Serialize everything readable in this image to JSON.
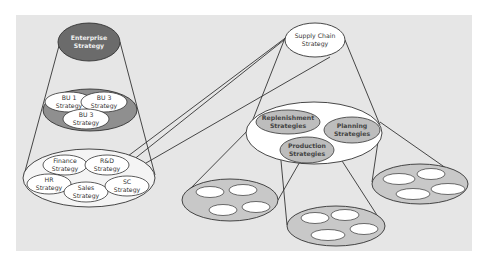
{
  "diagram": {
    "colors": {
      "panel": "#e6e6e6",
      "enterprise_fill": "#6b6b6b",
      "bu_container_fill": "#8f8f8f",
      "functional_container_fill": "#f4f4f4",
      "node_fill": "#ffffff",
      "sc_sub_fill": "#bdbdbd",
      "leaf_container_fill": "#c8c8c8",
      "stroke": "#333333"
    },
    "enterprise": {
      "label_line1": "Enterprise",
      "label_line2": "Strategy"
    },
    "business_units": [
      {
        "line1": "BU 1",
        "line2": "Strategy"
      },
      {
        "line1": "BU 3",
        "line2": "Strategy"
      },
      {
        "line1": "BU 3",
        "line2": "Strategy"
      }
    ],
    "functional": [
      {
        "line1": "Finance",
        "line2": "Strategy"
      },
      {
        "line1": "R&D",
        "line2": "Strategy"
      },
      {
        "line1": "HR",
        "line2": "Strategy"
      },
      {
        "line1": "Sales",
        "line2": "Strategy"
      },
      {
        "line1": "SC",
        "line2": "Strategy"
      }
    ],
    "supply_chain": {
      "label_line1": "Supply Chain",
      "label_line2": "Strategy"
    },
    "supply_chain_sub": [
      {
        "line1": "Replenishment",
        "line2": "Strategies"
      },
      {
        "line1": "Planning",
        "line2": "Strategies"
      },
      {
        "line1": "Production",
        "line2": "Strategies"
      }
    ],
    "leaf_groups": [
      {
        "name": "Replenishment",
        "leaf_count": 4
      },
      {
        "name": "Production",
        "leaf_count": 4
      },
      {
        "name": "Planning",
        "leaf_count": 4
      }
    ]
  }
}
